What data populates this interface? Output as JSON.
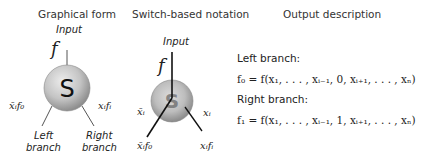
{
  "headers": {
    "graphical": "Graphical form",
    "switch": "Switch-based notation",
    "output": "Output description"
  },
  "graphical": {
    "input_label": "Input",
    "f_label": "f",
    "node_label": "S",
    "left_edge_label": "x̄ᵢf₀",
    "right_edge_label": "xᵢfᵢ",
    "left_branch_line1": "Left",
    "left_branch_line2": "branch",
    "right_branch_line1": "Right",
    "right_branch_line2": "branch"
  },
  "switch": {
    "input_label": "Input",
    "f_label": "f",
    "node_label": "S",
    "left_edge_label": "x̄ᵢ",
    "right_edge_label": "xᵢ",
    "left_out_label": "x̄ᵢf₀",
    "right_out_label": "xᵢfᵢ"
  },
  "output": {
    "left_title": "Left branch:",
    "left_eq": "f₀ = f(x₁, . . . , xᵢ₋₁, 0,  xᵢ₊₁, . . . , xₙ)",
    "right_title": "Right branch:",
    "right_eq": "f₁ = f(x₁, . . . , xᵢ₋₁, 1,  xᵢ₊₁, . . . , xₙ)"
  },
  "colors": {
    "node_fill_light": "#e4e4e4",
    "node_fill_dark": "#9a9a9a",
    "line": "#333333"
  }
}
